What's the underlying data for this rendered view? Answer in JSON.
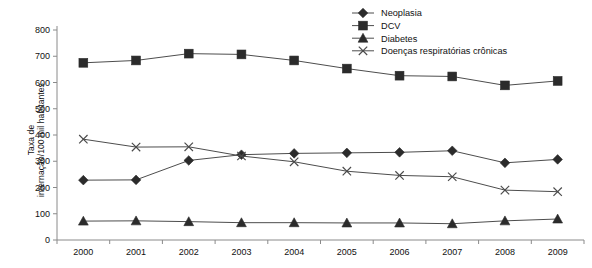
{
  "chart_data": {
    "type": "line",
    "title": "",
    "xlabel": "",
    "ylabel": "Taxa de internação/100 mil habitantes",
    "ylabel_lines": [
      "Taxa de",
      "internação/100 mil habitantes"
    ],
    "categories": [
      "2000",
      "2001",
      "2002",
      "2003",
      "2004",
      "2005",
      "2006",
      "2007",
      "2008",
      "2009"
    ],
    "ylim": [
      0,
      800
    ],
    "yticks": [
      0,
      100,
      200,
      300,
      400,
      500,
      600,
      700,
      800
    ],
    "ytick_labels": [
      "0",
      "100",
      "200",
      "300",
      "400",
      "500",
      "600",
      "700",
      "800"
    ],
    "grid": false,
    "legend_position": "top-right",
    "series": [
      {
        "name": "Neoplasia",
        "marker": "diamond",
        "color": "#2b2b2b",
        "values": [
          228,
          229,
          303,
          325,
          330,
          332,
          334,
          340,
          294,
          307
        ]
      },
      {
        "name": "DCV",
        "marker": "square",
        "color": "#2b2b2b",
        "values": [
          675,
          684,
          710,
          707,
          684,
          653,
          626,
          623,
          589,
          606
        ]
      },
      {
        "name": "Diabetes",
        "marker": "triangle",
        "color": "#2b2b2b",
        "values": [
          72,
          73,
          70,
          66,
          66,
          65,
          65,
          62,
          73,
          80
        ]
      },
      {
        "name": "Doenças respiratórias crônicas",
        "marker": "x",
        "color": "#4a4a4a",
        "values": [
          384,
          354,
          355,
          320,
          298,
          262,
          246,
          241,
          190,
          184
        ]
      }
    ]
  }
}
